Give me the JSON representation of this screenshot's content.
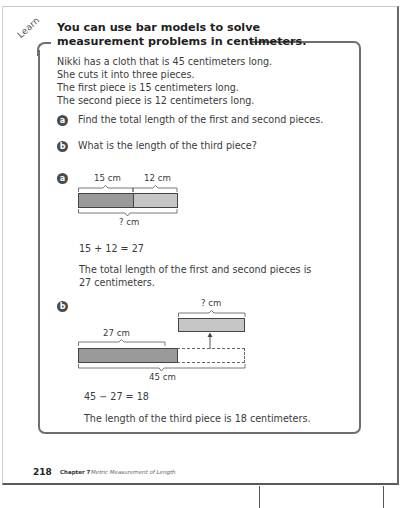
{
  "lesson": {
    "tag": "Learn",
    "heading_line1": "You can use bar models to solve",
    "heading_line2": "measurement problems in centimeters.",
    "problem": [
      "Nikki has a cloth that is 45 centimeters long.",
      "She cuts it into three pieces.",
      "The first piece is 15 centimeters long.",
      "The second piece is 12 centimeters long."
    ],
    "questions": [
      {
        "badge": "a",
        "text": "Find the total length of the first and second pieces."
      },
      {
        "badge": "b",
        "text": "What is the length of the third piece?"
      }
    ]
  },
  "part_a": {
    "badge": "a",
    "model": {
      "first_label": "15 cm",
      "second_label": "12 cm",
      "total_label": "? cm"
    },
    "equation": "15 + 12 = 27",
    "answer_line1": "The total length of the first and second pieces is",
    "answer_line2": "27 centimeters."
  },
  "part_b": {
    "badge": "b",
    "model": {
      "known_label": "27 cm",
      "unknown_label": "? cm",
      "total_label": "45 cm"
    },
    "equation": "45 − 27 = 18",
    "answer": "The length of the third piece is 18 centimeters."
  },
  "footer": {
    "page_number": "218",
    "chapter": "Chapter 7",
    "chapter_title": "Metric Measurement of Length"
  },
  "colors": {
    "bar_dark": "#9a9a9a",
    "bar_light": "#c6c6c6",
    "box_border": "#6e6e6e",
    "badge": "#4a4a4a"
  }
}
